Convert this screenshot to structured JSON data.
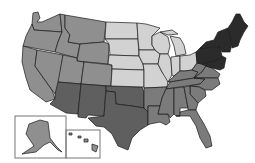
{
  "map": {
    "title": "",
    "type": "choropleth",
    "region": "United States",
    "legend": [],
    "shade_classes": {
      "darkest": "#2b2b2b",
      "dark": "#5f5f5f",
      "medium_dark": "#7b7b7b",
      "medium": "#8f8f8f",
      "light": "#d2d2d2"
    },
    "regions": {
      "west": {
        "shade": "medium",
        "color": "#8f8f8f",
        "states": [
          "WA",
          "OR",
          "CA",
          "NV",
          "ID",
          "MT",
          "WY",
          "UT",
          "CO",
          "AK",
          "HI"
        ]
      },
      "southwest": {
        "shade": "dark",
        "color": "#5f5f5f",
        "states": [
          "AZ",
          "NM",
          "TX",
          "OK"
        ]
      },
      "midwest": {
        "shade": "light",
        "color": "#d2d2d2",
        "states": [
          "ND",
          "SD",
          "NE",
          "KS",
          "MN",
          "IA",
          "MO",
          "WI",
          "IL",
          "MI",
          "IN",
          "OH"
        ]
      },
      "southeast": {
        "shade": "medium_dark",
        "color": "#7b7b7b",
        "states": [
          "AR",
          "LA",
          "MS",
          "AL",
          "GA",
          "FL",
          "SC",
          "NC",
          "TN",
          "KY",
          "VA",
          "WV"
        ]
      },
      "northeast": {
        "shade": "darkest",
        "color": "#2b2b2b",
        "states": [
          "PA",
          "NY",
          "NJ",
          "DE",
          "MD",
          "CT",
          "RI",
          "MA",
          "VT",
          "NH",
          "ME"
        ]
      }
    },
    "insets": [
      "Alaska",
      "Hawaii"
    ]
  }
}
